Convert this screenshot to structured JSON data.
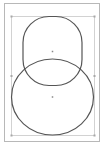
{
  "canvas": {
    "width": 105,
    "height": 146,
    "background": "#ffffff"
  },
  "page": {
    "x": 4.5,
    "y": 3.5,
    "width": 95,
    "height": 138,
    "stroke": "#b8b8b8"
  },
  "selection": {
    "x": 11.5,
    "y": 16.5,
    "width": 83,
    "height": 119,
    "stroke": "#c8c8c8",
    "handle_color": "#a8a8a8",
    "handles": [
      {
        "name": "top-left",
        "x": 11.5,
        "y": 16.5
      },
      {
        "name": "top-right",
        "x": 94.5,
        "y": 16.5
      },
      {
        "name": "middle-left",
        "x": 11.5,
        "y": 76
      },
      {
        "name": "middle-right",
        "x": 94.5,
        "y": 76
      },
      {
        "name": "bottom-left",
        "x": 11.5,
        "y": 135.5
      },
      {
        "name": "bottom-right",
        "x": 94.5,
        "y": 135.5
      }
    ]
  },
  "shapes": [
    {
      "type": "rounded-rectangle",
      "x": 23,
      "y": 16.5,
      "width": 59,
      "height": 69,
      "radius": 26,
      "stroke": "#555555",
      "stroke_width": 1.2,
      "center": {
        "x": 52.5,
        "y": 51.5
      }
    },
    {
      "type": "ellipse",
      "cx": 52.5,
      "cy": 97,
      "rx": 41,
      "ry": 38,
      "stroke": "#555555",
      "stroke_width": 1.2,
      "center": {
        "x": 52.5,
        "y": 97
      }
    }
  ],
  "center_marker_color": "#888888"
}
